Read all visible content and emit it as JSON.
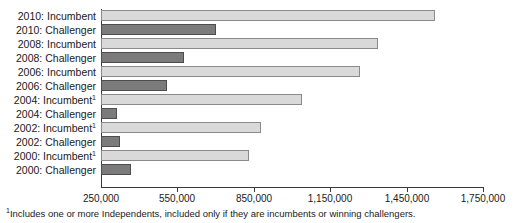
{
  "chart_data": {
    "type": "bar",
    "orientation": "horizontal",
    "title": "",
    "subtitle": "",
    "xlabel": "",
    "ylabel": "",
    "xlim": [
      250000,
      1750000
    ],
    "grid": false,
    "legend": "none",
    "tick_labels": [
      "250,000",
      "550,000",
      "850,000",
      "1,150,000",
      "1,450,000",
      "1,750,000"
    ],
    "tick_values": [
      250000,
      550000,
      850000,
      1150000,
      1450000,
      1750000
    ],
    "categories": [
      "2010: Incumbent",
      "2010: Challenger",
      "2008: Incumbent",
      "2008: Challenger",
      "2006: Incumbent",
      "2006: Challenger",
      "2004: Incumbent",
      "2004: Challenger",
      "2002: Incumbent",
      "2002: Challenger",
      "2000: Incumbent",
      "2000: Challenger"
    ],
    "values": [
      1562000,
      702000,
      1338000,
      576000,
      1267000,
      509000,
      1039000,
      313000,
      878000,
      325000,
      831000,
      368000
    ],
    "bars": [
      {
        "label": "2010: Incumbent",
        "year": "2010",
        "role": "Incumbent",
        "footnote_marker": "",
        "value": 1562000,
        "series": "incumbent"
      },
      {
        "label": "2010: Challenger",
        "year": "2010",
        "role": "Challenger",
        "footnote_marker": "",
        "value": 702000,
        "series": "challenger"
      },
      {
        "label": "2008: Incumbent",
        "year": "2008",
        "role": "Incumbent",
        "footnote_marker": "",
        "value": 1338000,
        "series": "incumbent"
      },
      {
        "label": "2008: Challenger",
        "year": "2008",
        "role": "Challenger",
        "footnote_marker": "",
        "value": 576000,
        "series": "challenger"
      },
      {
        "label": "2006: Incumbent",
        "year": "2006",
        "role": "Incumbent",
        "footnote_marker": "",
        "value": 1267000,
        "series": "incumbent"
      },
      {
        "label": "2006: Challenger",
        "year": "2006",
        "role": "Challenger",
        "footnote_marker": "",
        "value": 509000,
        "series": "challenger"
      },
      {
        "label": "2004: Incumbent",
        "year": "2004",
        "role": "Incumbent",
        "footnote_marker": "1",
        "value": 1039000,
        "series": "incumbent"
      },
      {
        "label": "2004: Challenger",
        "year": "2004",
        "role": "Challenger",
        "footnote_marker": "",
        "value": 313000,
        "series": "challenger"
      },
      {
        "label": "2002: Incumbent",
        "year": "2002",
        "role": "Incumbent",
        "footnote_marker": "1",
        "value": 878000,
        "series": "incumbent"
      },
      {
        "label": "2002: Challenger",
        "year": "2002",
        "role": "Challenger",
        "footnote_marker": "",
        "value": 325000,
        "series": "challenger"
      },
      {
        "label": "2000: Incumbent",
        "year": "2000",
        "role": "Incumbent",
        "footnote_marker": "1",
        "value": 831000,
        "series": "incumbent"
      },
      {
        "label": "2000: Challenger",
        "year": "2000",
        "role": "Challenger",
        "footnote_marker": "",
        "value": 368000,
        "series": "challenger"
      }
    ],
    "series_colors": {
      "incumbent": "#d9d9d9",
      "challenger": "#7b7b7b",
      "axis": "#3a3a3a"
    }
  },
  "footnote": {
    "marker": "1",
    "text": "Includes one or more Independents, included only if they are incumbents or winning challengers."
  }
}
